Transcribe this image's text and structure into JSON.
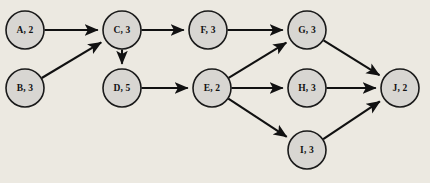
{
  "diagram": {
    "background_color": "#ece9e1",
    "node_fill_color": "#d8d6d2",
    "node_stroke_color": "#1a1a1a",
    "edge_color": "#111111",
    "node_radius": 19,
    "nodes": [
      {
        "id": "A",
        "label": "A, 2",
        "name": "A",
        "duration": "2",
        "cx": 25,
        "cy": 30
      },
      {
        "id": "B",
        "label": "B, 3",
        "name": "B",
        "duration": "3",
        "cx": 25,
        "cy": 88
      },
      {
        "id": "C",
        "label": "C, 3",
        "name": "C",
        "duration": "3",
        "cx": 122,
        "cy": 30
      },
      {
        "id": "D",
        "label": "D, 5",
        "name": "D",
        "duration": "5",
        "cx": 122,
        "cy": 88
      },
      {
        "id": "F",
        "label": "F, 3",
        "name": "F",
        "duration": "3",
        "cx": 208,
        "cy": 30
      },
      {
        "id": "E",
        "label": "E, 2",
        "name": "E",
        "duration": "2",
        "cx": 212,
        "cy": 88
      },
      {
        "id": "G",
        "label": "G, 3",
        "name": "G",
        "duration": "3",
        "cx": 307,
        "cy": 30
      },
      {
        "id": "H",
        "label": "H, 3",
        "name": "H",
        "duration": "3",
        "cx": 307,
        "cy": 88
      },
      {
        "id": "I",
        "label": "I, 3",
        "name": "I",
        "duration": "3",
        "cx": 307,
        "cy": 150
      },
      {
        "id": "J",
        "label": "J, 2",
        "name": "J",
        "duration": "2",
        "cx": 400,
        "cy": 88
      }
    ],
    "edges": [
      {
        "from": "A",
        "to": "C"
      },
      {
        "from": "B",
        "to": "C"
      },
      {
        "from": "C",
        "to": "F"
      },
      {
        "from": "C",
        "to": "D"
      },
      {
        "from": "D",
        "to": "E"
      },
      {
        "from": "F",
        "to": "G"
      },
      {
        "from": "E",
        "to": "G"
      },
      {
        "from": "E",
        "to": "H"
      },
      {
        "from": "E",
        "to": "I"
      },
      {
        "from": "G",
        "to": "J"
      },
      {
        "from": "H",
        "to": "J"
      },
      {
        "from": "I",
        "to": "J"
      }
    ]
  }
}
